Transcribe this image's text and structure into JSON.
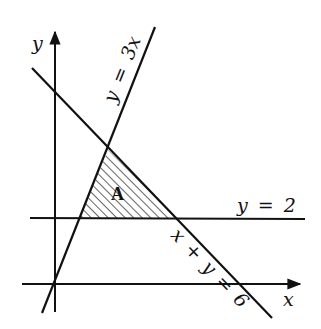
{
  "diagram": {
    "type": "linear-inequality-region",
    "axes": {
      "x_label": "x",
      "y_label": "y"
    },
    "lines": [
      {
        "id": "line-y-3x",
        "equation": "y = 3x",
        "label": "y = 3x"
      },
      {
        "id": "line-x-plus-y-6",
        "equation": "x + y = 6",
        "label": "x + y = 6"
      },
      {
        "id": "line-y-2",
        "equation": "y = 2",
        "label": "y = 2"
      }
    ],
    "region": {
      "label": "A",
      "fill": "hatched",
      "bounded_by": [
        "y = 3x",
        "x + y = 6",
        "y = 2"
      ],
      "vertices": [
        [
          1.5,
          4.5
        ],
        [
          0.6667,
          2
        ],
        [
          4,
          2
        ]
      ]
    },
    "colors": {
      "stroke": "#111111",
      "background": "#ffffff"
    }
  }
}
